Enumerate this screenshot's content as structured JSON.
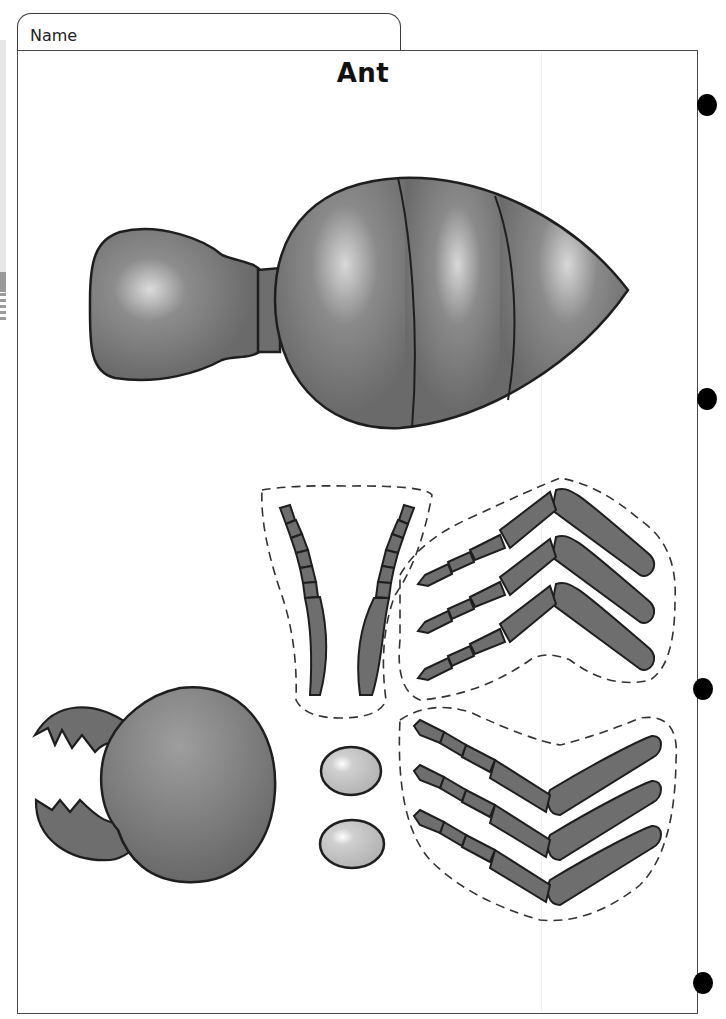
{
  "header": {
    "name_label": "Name",
    "title": "Ant"
  },
  "worksheet": {
    "type": "cut-out craft template",
    "parts": [
      {
        "id": "abdomen-thorax",
        "description": "thorax and segmented abdomen body piece"
      },
      {
        "id": "antennae",
        "description": "pair of segmented antennae (dashed cut line)"
      },
      {
        "id": "legs-left",
        "description": "three jointed legs, upper group (dashed cut line)"
      },
      {
        "id": "legs-right",
        "description": "three jointed legs, lower group (dashed cut line)"
      },
      {
        "id": "head",
        "description": "head with two serrated mandibles"
      },
      {
        "id": "eyes",
        "description": "two oval eyes"
      }
    ]
  },
  "binder_holes": 4,
  "colors": {
    "body_fill": "#6e6e6e",
    "highlight": "#d6d6d6",
    "outline": "#1e1e1e",
    "eye_fill": "#bdbdbd",
    "cut_line": "#333333"
  }
}
